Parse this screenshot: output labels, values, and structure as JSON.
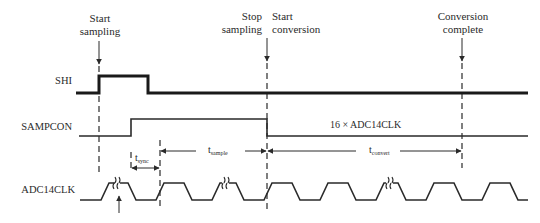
{
  "diagram": {
    "annotations": {
      "start_sampling": [
        "Start",
        "sampling"
      ],
      "stop_sampling": [
        "Stop",
        "sampling"
      ],
      "start_conversion": [
        "Start",
        "conversion"
      ],
      "conversion_complete": [
        "Conversion",
        "complete"
      ]
    },
    "signals": {
      "shi": "SHI",
      "sampcon": "SAMPCON",
      "adc14clk": "ADC14CLK"
    },
    "sampcon_note": "16 × ADC14CLK",
    "timings": {
      "t_sync": {
        "main": "t",
        "sub": "sync"
      },
      "t_sample": {
        "main": "t",
        "sub": "sample"
      },
      "t_convert": {
        "main": "t",
        "sub": "convert"
      }
    },
    "colors": {
      "line": "#2a2a2a",
      "background": "#ffffff"
    }
  }
}
